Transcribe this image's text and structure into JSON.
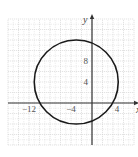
{
  "chart_data": {
    "type": "line",
    "title": "",
    "xlabel": "x",
    "ylabel": "y",
    "xlim": [
      -16,
      8
    ],
    "ylim": [
      -8,
      16
    ],
    "grid": true,
    "grid_major_step": 2,
    "x_tick_labels": [
      {
        "value": -12,
        "label": "−12"
      },
      {
        "value": -4,
        "label": "−4"
      },
      {
        "value": 4,
        "label": "4"
      }
    ],
    "y_tick_labels": [
      {
        "value": 4,
        "label": "4"
      },
      {
        "value": 8,
        "label": "8"
      }
    ],
    "series": [
      {
        "name": "circle",
        "shape": "circle",
        "center": [
          -3,
          4
        ],
        "radius": 8,
        "equation": "(x+3)^2 + (y-4)^2 = 64"
      }
    ]
  },
  "colors": {
    "grid": "#d0d0d0",
    "axis": "#333333",
    "curve": "#1a1a1a"
  }
}
